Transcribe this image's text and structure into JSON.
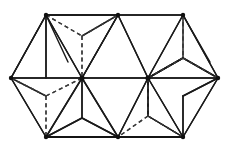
{
  "figure": {
    "background_color": "#ffffff",
    "solid_edge_color": "#1a1a1a",
    "dashed_edge_color": "#3a3a3a",
    "vertex_color": "#101010",
    "canvas": {
      "width": 230,
      "height": 148
    }
  },
  "geometry": {
    "vertices": {
      "left": {
        "name": "left-apex",
        "x": 11,
        "y": 78
      },
      "top_left": {
        "name": "top-left-corner",
        "x": 46,
        "y": 15
      },
      "top_mid": {
        "name": "top-middle-corner",
        "x": 118,
        "y": 15
      },
      "top_right": {
        "name": "top-right-corner",
        "x": 183,
        "y": 15
      },
      "right": {
        "name": "right-apex",
        "x": 218,
        "y": 78
      },
      "bottom_right": {
        "name": "bottom-right-corner",
        "x": 183,
        "y": 137
      },
      "bottom_mid": {
        "name": "bottom-middle-corner",
        "x": 118,
        "y": 137
      },
      "bottom_left": {
        "name": "bottom-left-corner",
        "x": 46,
        "y": 137
      },
      "hub_left": {
        "name": "left-hub",
        "x": 82,
        "y": 78
      },
      "hub_right": {
        "name": "right-hub",
        "x": 148,
        "y": 78
      },
      "hidden_top_left": {
        "name": "hidden-upper-left-node",
        "x": 82,
        "y": 36
      },
      "hidden_bottom_left": {
        "name": "hidden-lower-left-node",
        "x": 46,
        "y": 96
      },
      "hidden_top_right": {
        "name": "hidden-upper-right-node",
        "x": 183,
        "y": 58
      },
      "hidden_bottom_right": {
        "name": "hidden-lower-right-node",
        "x": 148,
        "y": 116
      }
    },
    "solid_edges": [
      [
        11,
        78,
        46,
        15
      ],
      [
        46,
        15,
        118,
        15
      ],
      [
        118,
        15,
        183,
        15
      ],
      [
        183,
        15,
        218,
        78
      ],
      [
        218,
        78,
        183,
        137
      ],
      [
        183,
        137,
        118,
        137
      ],
      [
        118,
        137,
        46,
        137
      ],
      [
        46,
        137,
        11,
        78
      ],
      [
        11,
        78,
        82,
        78
      ],
      [
        82,
        78,
        148,
        78
      ],
      [
        148,
        78,
        218,
        78
      ],
      [
        46,
        15,
        82,
        78
      ],
      [
        118,
        15,
        82,
        78
      ],
      [
        118,
        15,
        148,
        78
      ],
      [
        183,
        15,
        148,
        78
      ],
      [
        46,
        137,
        82,
        78
      ],
      [
        118,
        137,
        82,
        78
      ],
      [
        118,
        137,
        148,
        78
      ],
      [
        183,
        137,
        148,
        78
      ],
      [
        11,
        78,
        46,
        15
      ],
      [
        46,
        15,
        68,
        62
      ],
      [
        183,
        15,
        210,
        62
      ],
      [
        148,
        78,
        183,
        58
      ],
      [
        82,
        78,
        118,
        15
      ],
      [
        118,
        15,
        46,
        15
      ],
      [
        46,
        137,
        82,
        118
      ],
      [
        82,
        118,
        118,
        137
      ],
      [
        82,
        78,
        82,
        118
      ],
      [
        148,
        78,
        183,
        58
      ],
      [
        183,
        58,
        218,
        78
      ],
      [
        183,
        15,
        183,
        58
      ],
      [
        148,
        116,
        183,
        137
      ],
      [
        148,
        78,
        148,
        116
      ],
      [
        82,
        36,
        118,
        15
      ],
      [
        46,
        15,
        46,
        78
      ],
      [
        11,
        78,
        46,
        96
      ],
      [
        183,
        137,
        183,
        96
      ],
      [
        183,
        96,
        218,
        78
      ],
      [
        148,
        116,
        148,
        78
      ]
    ],
    "dashed_edges": [
      [
        46,
        15,
        82,
        36
      ],
      [
        82,
        36,
        118,
        15
      ],
      [
        82,
        36,
        82,
        78
      ],
      [
        11,
        78,
        46,
        96
      ],
      [
        46,
        96,
        82,
        78
      ],
      [
        46,
        96,
        46,
        137
      ],
      [
        183,
        15,
        183,
        58
      ],
      [
        183,
        58,
        148,
        78
      ],
      [
        183,
        58,
        218,
        78
      ],
      [
        148,
        78,
        148,
        116
      ],
      [
        148,
        116,
        118,
        137
      ],
      [
        148,
        116,
        183,
        137
      ]
    ]
  },
  "labels": {
    "has_text_labels": false,
    "visible_text": ""
  }
}
